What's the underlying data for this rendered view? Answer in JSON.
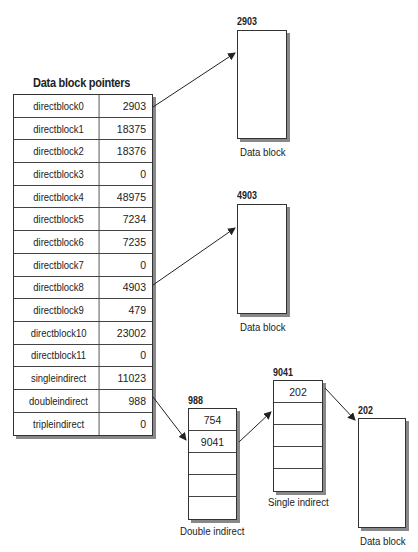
{
  "pointer_table": {
    "title": "Data block pointers",
    "rows": [
      {
        "name": "directblock0",
        "value": "2903"
      },
      {
        "name": "directblock1",
        "value": "18375"
      },
      {
        "name": "directblock2",
        "value": "18376"
      },
      {
        "name": "directblock3",
        "value": "0"
      },
      {
        "name": "directblock4",
        "value": "48975"
      },
      {
        "name": "directblock5",
        "value": "7234"
      },
      {
        "name": "directblock6",
        "value": "7235"
      },
      {
        "name": "directblock7",
        "value": "0"
      },
      {
        "name": "directblock8",
        "value": "4903"
      },
      {
        "name": "directblock9",
        "value": "479"
      },
      {
        "name": "directblock10",
        "value": "23002"
      },
      {
        "name": "directblock11",
        "value": "0"
      },
      {
        "name": "singleindirect",
        "value": "11023"
      },
      {
        "name": "doubleindirect",
        "value": "988"
      },
      {
        "name": "tripleindirect",
        "value": "0"
      }
    ]
  },
  "data_block_1": {
    "label": "2903",
    "caption": "Data block"
  },
  "data_block_2": {
    "label": "4903",
    "caption": "Data block"
  },
  "double_indirect": {
    "label": "988",
    "caption": "Double indirect",
    "cells": [
      "754",
      "9041",
      "",
      "",
      ""
    ]
  },
  "single_indirect": {
    "label": "9041",
    "caption": "Single indirect",
    "cells": [
      "202",
      "",
      "",
      "",
      ""
    ]
  },
  "data_block_3": {
    "label": "202",
    "caption": "Data block"
  }
}
